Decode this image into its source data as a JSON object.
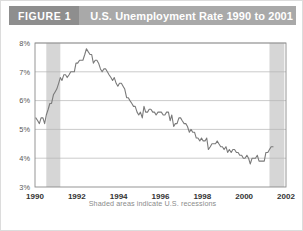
{
  "header": {
    "figure_label": "FIGURE 1",
    "title": "U.S. Unemployment Rate 1990 to 2001",
    "label_bg": "#8e8e8e",
    "title_bg": "#a9a9a9",
    "text_color": "#ffffff"
  },
  "caption": "Shaded areas indicate U.S. recessions",
  "chart_data": {
    "type": "line",
    "title": "U.S. Unemployment Rate 1990 to 2001",
    "xlabel": "",
    "ylabel": "",
    "xlim": [
      1990,
      2002
    ],
    "ylim": [
      3,
      8
    ],
    "grid": true,
    "legend": "none",
    "line_color": "#7a7a7a",
    "shade_color": "#d6d6d6",
    "axis_color": "#8a8a8a",
    "grid_color": "#b5b5b5",
    "tick_label_color": "#555555",
    "ytick_labels": [
      "3%",
      "4%",
      "5%",
      "6%",
      "7%",
      "8%"
    ],
    "ytick_values": [
      3,
      4,
      5,
      6,
      7,
      8
    ],
    "xtick_labels": [
      "1990",
      "1992",
      "1994",
      "1996",
      "1998",
      "2000",
      "2002"
    ],
    "xtick_values": [
      1990,
      1992,
      1994,
      1996,
      1998,
      2000,
      2002
    ],
    "shaded_regions": [
      {
        "label": "1990-1991 recession",
        "start": 1990.54,
        "end": 1991.21
      },
      {
        "label": "2001 recession",
        "start": 2001.21,
        "end": 2001.92
      }
    ],
    "series": [
      {
        "name": "U.S. unemployment rate",
        "x": [
          1990.04,
          1990.13,
          1990.21,
          1990.29,
          1990.38,
          1990.46,
          1990.54,
          1990.63,
          1990.71,
          1990.79,
          1990.88,
          1990.96,
          1991.04,
          1991.13,
          1991.21,
          1991.29,
          1991.38,
          1991.46,
          1991.54,
          1991.63,
          1991.71,
          1991.79,
          1991.88,
          1991.96,
          1992.04,
          1992.13,
          1992.21,
          1992.29,
          1992.38,
          1992.46,
          1992.54,
          1992.63,
          1992.71,
          1992.79,
          1992.88,
          1992.96,
          1993.04,
          1993.13,
          1993.21,
          1993.29,
          1993.38,
          1993.46,
          1993.54,
          1993.63,
          1993.71,
          1993.79,
          1993.88,
          1993.96,
          1994.04,
          1994.13,
          1994.21,
          1994.29,
          1994.38,
          1994.46,
          1994.54,
          1994.63,
          1994.71,
          1994.79,
          1994.88,
          1994.96,
          1995.04,
          1995.13,
          1995.21,
          1995.29,
          1995.38,
          1995.46,
          1995.54,
          1995.63,
          1995.71,
          1995.79,
          1995.88,
          1995.96,
          1996.04,
          1996.13,
          1996.21,
          1996.29,
          1996.38,
          1996.46,
          1996.54,
          1996.63,
          1996.71,
          1996.79,
          1996.88,
          1996.96,
          1997.04,
          1997.13,
          1997.21,
          1997.29,
          1997.38,
          1997.46,
          1997.54,
          1997.63,
          1997.71,
          1997.79,
          1997.88,
          1997.96,
          1998.04,
          1998.13,
          1998.21,
          1998.29,
          1998.38,
          1998.46,
          1998.54,
          1998.63,
          1998.71,
          1998.79,
          1998.88,
          1998.96,
          1999.04,
          1999.13,
          1999.21,
          1999.29,
          1999.38,
          1999.46,
          1999.54,
          1999.63,
          1999.71,
          1999.79,
          1999.88,
          1999.96,
          2000.04,
          2000.13,
          2000.21,
          2000.29,
          2000.38,
          2000.46,
          2000.54,
          2000.63,
          2000.71,
          2000.79,
          2000.88,
          2000.96,
          2001.04,
          2001.13,
          2001.21,
          2001.29,
          2001.38
        ],
        "values": [
          5.4,
          5.3,
          5.2,
          5.4,
          5.4,
          5.2,
          5.5,
          5.7,
          5.9,
          5.9,
          6.2,
          6.3,
          6.4,
          6.6,
          6.8,
          6.7,
          6.9,
          6.9,
          6.8,
          6.9,
          7.0,
          7.0,
          7.0,
          7.3,
          7.3,
          7.4,
          7.4,
          7.4,
          7.6,
          7.8,
          7.7,
          7.6,
          7.6,
          7.3,
          7.4,
          7.4,
          7.3,
          7.1,
          7.0,
          7.1,
          7.1,
          7.0,
          6.9,
          6.8,
          6.7,
          6.8,
          6.6,
          6.5,
          6.6,
          6.6,
          6.5,
          6.4,
          6.1,
          6.1,
          6.0,
          5.9,
          5.8,
          5.8,
          5.6,
          5.5,
          5.6,
          5.4,
          5.8,
          5.6,
          5.6,
          5.7,
          5.7,
          5.6,
          5.6,
          5.5,
          5.6,
          5.6,
          5.6,
          5.5,
          5.5,
          5.6,
          5.6,
          5.3,
          5.5,
          5.1,
          5.2,
          5.2,
          5.4,
          5.4,
          5.3,
          5.2,
          5.2,
          5.1,
          4.9,
          5.0,
          4.9,
          4.9,
          4.7,
          4.7,
          4.6,
          4.7,
          4.6,
          4.6,
          4.7,
          4.3,
          4.4,
          4.5,
          4.5,
          4.5,
          4.6,
          4.5,
          4.4,
          4.4,
          4.3,
          4.4,
          4.2,
          4.3,
          4.2,
          4.3,
          4.3,
          4.2,
          4.2,
          4.1,
          4.1,
          4.0,
          4.0,
          4.1,
          4.0,
          3.8,
          4.0,
          4.0,
          4.0,
          4.1,
          3.9,
          3.9,
          3.9,
          3.9,
          4.2,
          4.2,
          4.3,
          4.4,
          4.4
        ]
      }
    ]
  }
}
